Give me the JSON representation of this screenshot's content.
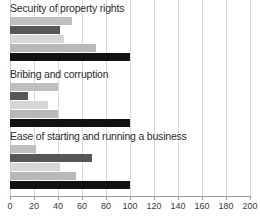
{
  "chart_data": {
    "type": "bar",
    "orientation": "horizontal",
    "title": "",
    "xlabel": "",
    "ylabel": "",
    "xlim": [
      0,
      200
    ],
    "xticks": [
      0,
      20,
      40,
      60,
      80,
      100,
      120,
      140,
      160,
      180,
      200
    ],
    "xtick_labels": [
      "0",
      "20",
      "40",
      "60",
      "80",
      "100",
      "120",
      "140",
      "160",
      "180",
      "200"
    ],
    "grid": true,
    "legend": "none",
    "groups": [
      {
        "label": "Security of property rights",
        "bars": [
          {
            "name": "series-1",
            "value": 52,
            "color": "#bfbfbf"
          },
          {
            "name": "series-2",
            "value": 42,
            "color": "#575757"
          },
          {
            "name": "series-3",
            "value": 45,
            "color": "#d6d6d6"
          },
          {
            "name": "series-4",
            "value": 72,
            "color": "#b8b8b8"
          },
          {
            "name": "series-5",
            "value": 100,
            "color": "#111111"
          }
        ]
      },
      {
        "label": "Bribing and corruption",
        "bars": [
          {
            "name": "series-1",
            "value": 40,
            "color": "#bfbfbf"
          },
          {
            "name": "series-2",
            "value": 15,
            "color": "#575757"
          },
          {
            "name": "series-3",
            "value": 32,
            "color": "#d6d6d6"
          },
          {
            "name": "series-4",
            "value": 40,
            "color": "#b8b8b8"
          },
          {
            "name": "series-5",
            "value": 100,
            "color": "#111111"
          }
        ]
      },
      {
        "label": "Ease of starting and running a business",
        "bars": [
          {
            "name": "series-1",
            "value": 22,
            "color": "#bfbfbf"
          },
          {
            "name": "series-2",
            "value": 68,
            "color": "#575757"
          },
          {
            "name": "series-3",
            "value": 42,
            "color": "#d6d6d6"
          },
          {
            "name": "series-4",
            "value": 55,
            "color": "#b8b8b8"
          },
          {
            "name": "series-5",
            "value": 100,
            "color": "#111111"
          }
        ]
      }
    ],
    "colors": {
      "light_gray": "#bfbfbf",
      "dark_gray": "#575757",
      "pale_gray": "#d6d6d6",
      "mid_gray": "#b8b8b8",
      "black": "#111111",
      "gridline": "#d9d9d9",
      "axis": "#9a9a9a",
      "text": "#2b2b2b"
    }
  }
}
